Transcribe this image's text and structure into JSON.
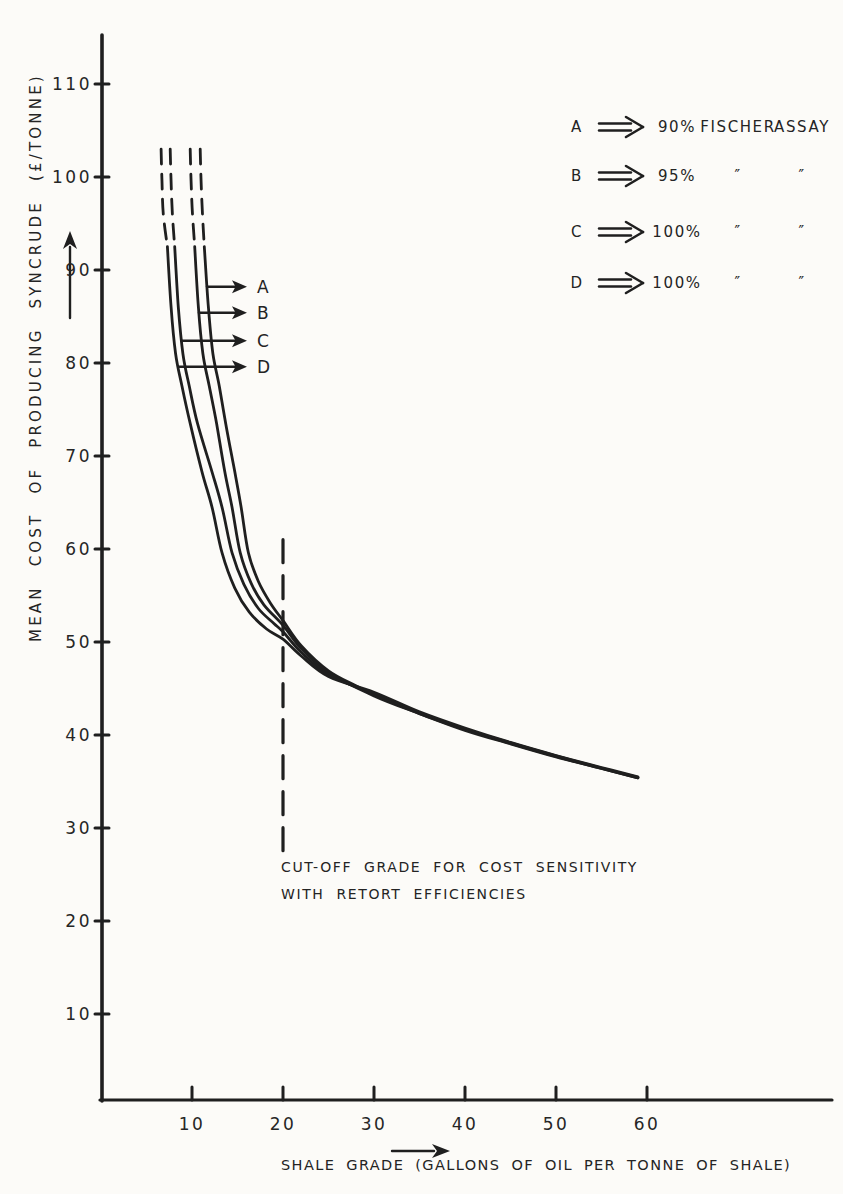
{
  "figure": {
    "background": "#fcfbf8",
    "ink": "#1f1f1f"
  },
  "chart_data": {
    "type": "line",
    "title": "",
    "xlabel": "SHALE GRADE (GALLONS OF OIL PER TONNE OF SHALE)",
    "ylabel": "MEAN COST OF PRODUCING SYNCRUDE (£/TONNE)",
    "x_ticks": [
      10,
      20,
      30,
      40,
      50,
      60
    ],
    "y_ticks": [
      10,
      20,
      30,
      40,
      50,
      60,
      70,
      80,
      90,
      100,
      110
    ],
    "xlim": [
      0,
      80
    ],
    "ylim": [
      0,
      115
    ],
    "grid": false,
    "legend_position": "top-right",
    "series": [
      {
        "name": "A",
        "meaning": "90% FISCHER ASSAY",
        "dashed_extension": [
          [
            10.9,
            103
          ],
          [
            11.0,
            99.5
          ],
          [
            11.15,
            96
          ],
          [
            11.35,
            92.5
          ]
        ],
        "points": [
          [
            11.35,
            92.5
          ],
          [
            11.8,
            86
          ],
          [
            12.3,
            81
          ],
          [
            13.0,
            77.5
          ],
          [
            13.7,
            73.5
          ],
          [
            14.7,
            68.3
          ],
          [
            15.4,
            64.5
          ],
          [
            16.2,
            59.6
          ],
          [
            17.3,
            56.5
          ],
          [
            18.6,
            54.2
          ],
          [
            20,
            52.3
          ],
          [
            22,
            49.6
          ],
          [
            25,
            46.9
          ],
          [
            28,
            45.3
          ],
          [
            30,
            44.3
          ],
          [
            33,
            43.1
          ],
          [
            35,
            42.3
          ],
          [
            40,
            40.6
          ],
          [
            45,
            39.1
          ],
          [
            50,
            37.7
          ],
          [
            55,
            36.4
          ],
          [
            59,
            35.4
          ]
        ]
      },
      {
        "name": "B",
        "meaning": "95% FISCHER ASSAY",
        "dashed_extension": [
          [
            9.8,
            103
          ],
          [
            9.9,
            99.5
          ],
          [
            10.05,
            96
          ],
          [
            10.3,
            92.5
          ]
        ],
        "points": [
          [
            10.3,
            92.5
          ],
          [
            10.7,
            86
          ],
          [
            11.2,
            81
          ],
          [
            11.9,
            77.5
          ],
          [
            12.7,
            73.5
          ],
          [
            13.6,
            68.3
          ],
          [
            14.4,
            64.5
          ],
          [
            15.3,
            59.6
          ],
          [
            16.5,
            56.3
          ],
          [
            17.9,
            54.0
          ],
          [
            20,
            51.8
          ],
          [
            22,
            49.3
          ],
          [
            25,
            46.7
          ],
          [
            30,
            44.2
          ],
          [
            35,
            42.3
          ],
          [
            40,
            40.5
          ],
          [
            45,
            39.05
          ],
          [
            50,
            37.65
          ],
          [
            55,
            36.4
          ],
          [
            59,
            35.4
          ]
        ]
      },
      {
        "name": "C",
        "meaning": "100% FISCHER ASSAY",
        "dashed_extension": [
          [
            7.6,
            103
          ],
          [
            7.7,
            99.5
          ],
          [
            7.85,
            96
          ],
          [
            8.1,
            92.5
          ]
        ],
        "points": [
          [
            8.1,
            92.5
          ],
          [
            8.5,
            86
          ],
          [
            9.0,
            81
          ],
          [
            9.7,
            77.5
          ],
          [
            10.6,
            73.5
          ],
          [
            12.2,
            68.3
          ],
          [
            13.3,
            64.5
          ],
          [
            14.4,
            59.6
          ],
          [
            15.7,
            56.2
          ],
          [
            17.3,
            53.6
          ],
          [
            19,
            52.0
          ],
          [
            20,
            51.1
          ],
          [
            22,
            48.9
          ],
          [
            25,
            46.5
          ],
          [
            30,
            44.4
          ],
          [
            35,
            42.4
          ],
          [
            40,
            40.65
          ],
          [
            45,
            39.15
          ],
          [
            50,
            37.75
          ],
          [
            55,
            36.45
          ],
          [
            59,
            35.45
          ]
        ]
      },
      {
        "name": "D",
        "meaning": "100% FISCHER ASSAY",
        "dashed_extension": [
          [
            6.6,
            103
          ],
          [
            6.7,
            99.5
          ],
          [
            6.85,
            96
          ],
          [
            7.3,
            92.5
          ]
        ],
        "points": [
          [
            7.3,
            92.5
          ],
          [
            7.7,
            86
          ],
          [
            8.2,
            81
          ],
          [
            8.9,
            77.5
          ],
          [
            9.8,
            73.5
          ],
          [
            11.1,
            68.3
          ],
          [
            12.2,
            64.5
          ],
          [
            13.3,
            59.6
          ],
          [
            14.7,
            55.8
          ],
          [
            16.3,
            53.2
          ],
          [
            18.2,
            51.4
          ],
          [
            20,
            50.3
          ],
          [
            22,
            48.5
          ],
          [
            25,
            46.3
          ],
          [
            30,
            44.6
          ],
          [
            35,
            42.5
          ],
          [
            40,
            40.75
          ],
          [
            45,
            39.2
          ],
          [
            50,
            37.8
          ],
          [
            55,
            36.5
          ],
          [
            59,
            35.5
          ]
        ]
      }
    ],
    "pointers": [
      {
        "label": "A",
        "cost": 88.2
      },
      {
        "label": "B",
        "cost": 85.4
      },
      {
        "label": "C",
        "cost": 82.4
      },
      {
        "label": "D",
        "cost": 79.6
      }
    ],
    "cutoff_line": {
      "grade": 20,
      "cost_top": 61,
      "cost_bottom": 27.5
    },
    "annotation": {
      "line1": "CUT-OFF GRADE FOR COST SENSITIVITY",
      "line2": "WITH RETORT EFFICIENCIES"
    }
  },
  "legend": {
    "rows": [
      {
        "letter": "A",
        "value": "90%",
        "col2": "FISCHER",
        "col3": "ASSAY"
      },
      {
        "letter": "B",
        "value": "95%",
        "col2": "″",
        "col3": "″"
      },
      {
        "letter": "C",
        "value": "100%",
        "col2": "″",
        "col3": "″"
      },
      {
        "letter": "D",
        "value": "100%",
        "col2": "″",
        "col3": "″"
      }
    ]
  }
}
